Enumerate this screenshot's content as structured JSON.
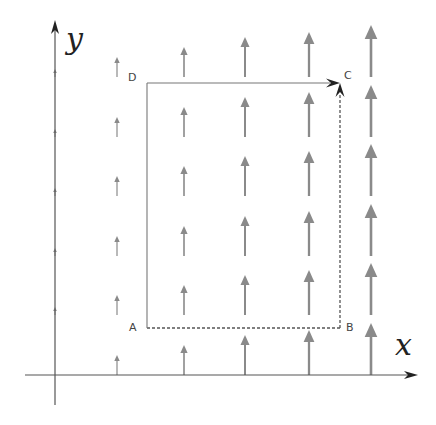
{
  "axes": {
    "x_label": "x",
    "y_label": "y",
    "origin": [
      55,
      375
    ],
    "x_end": 418,
    "x_start": 25,
    "y_top": 20,
    "y_bottom": 405,
    "color": "#555555"
  },
  "points": {
    "A": {
      "label": "A",
      "x": 147,
      "y": 328
    },
    "B": {
      "label": "B",
      "x": 340,
      "y": 328
    },
    "C": {
      "label": "C",
      "x": 340,
      "y": 83
    },
    "D": {
      "label": "D",
      "x": 147,
      "y": 83
    }
  },
  "path": {
    "segments": [
      {
        "from": "A",
        "to": "B",
        "style": "dashed"
      },
      {
        "from": "B",
        "to": "C",
        "style": "dashed",
        "arrow": true
      },
      {
        "from": "D",
        "to": "C",
        "style": "solid",
        "arrow": true
      },
      {
        "from": "A",
        "to": "D",
        "style": "solid"
      }
    ]
  },
  "vector_field": {
    "direction": "up",
    "description": "Vertical field whose magnitude increases with x",
    "columns": [
      {
        "x": 55,
        "length": 8,
        "width": 1.0,
        "head": 4
      },
      {
        "x": 117,
        "length": 20,
        "width": 1.2,
        "head": 6
      },
      {
        "x": 184,
        "length": 30,
        "width": 1.6,
        "head": 8
      },
      {
        "x": 245,
        "length": 40,
        "width": 2.0,
        "head": 10
      },
      {
        "x": 309,
        "length": 45,
        "width": 2.3,
        "head": 12
      },
      {
        "x": 371,
        "length": 52,
        "width": 2.6,
        "head": 14
      }
    ],
    "row_bases": [
      375,
      315,
      256,
      196,
      137,
      77
    ],
    "color": "#8a8a8a"
  }
}
